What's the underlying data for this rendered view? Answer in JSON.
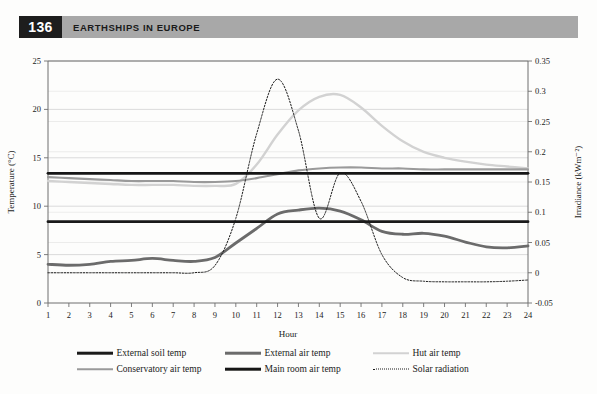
{
  "page": {
    "folio": "136",
    "running_title": "EARTHSHIPS IN EUROPE"
  },
  "colors": {
    "folio_box": "#1d1d1d",
    "running_bar": "#a8a8a8",
    "external_soil_temp": "#1a1a1a",
    "external_air_temp": "#6b6b6b",
    "hut_air_temp": "#d2d2d2",
    "conservatory_air_temp": "#9a9a9a",
    "main_room_air_temp": "#161616",
    "solar_radiation": "#1a1a1a",
    "grid": "#d7d7d7",
    "axis": "#6f6f6f"
  },
  "legend": {
    "items": [
      {
        "label": "External soil temp",
        "key": "external_soil_temp",
        "style": "solid",
        "weight": "thick",
        "color": "#1a1a1a"
      },
      {
        "label": "External air temp",
        "key": "external_air_temp",
        "style": "solid",
        "weight": "thick",
        "color": "#6b6b6b"
      },
      {
        "label": "Hut air temp",
        "key": "hut_air_temp",
        "style": "solid",
        "weight": "medium",
        "color": "#d2d2d2"
      },
      {
        "label": "Conservatory air temp",
        "key": "conservatory_air_temp",
        "style": "solid",
        "weight": "medium",
        "color": "#9a9a9a"
      },
      {
        "label": "Main room air temp",
        "key": "main_room_air_temp",
        "style": "solid",
        "weight": "thick",
        "color": "#161616"
      },
      {
        "label": "Solar radiation",
        "key": "solar_radiation",
        "style": "dotted",
        "weight": "thin",
        "color": "#1a1a1a"
      }
    ]
  },
  "chart_data": {
    "type": "line",
    "title": "",
    "xlabel": "Hour",
    "ylabel": "Temperature (°C)",
    "y2label": "Irradiance (kWm⁻²)",
    "xlim": [
      1,
      24
    ],
    "ylim": [
      0,
      25
    ],
    "y2lim": [
      -0.05,
      0.35
    ],
    "xticks": [
      1,
      2,
      3,
      4,
      5,
      6,
      7,
      8,
      9,
      10,
      11,
      12,
      13,
      14,
      15,
      16,
      17,
      18,
      19,
      20,
      21,
      22,
      23,
      24
    ],
    "yticks": [
      0,
      5,
      10,
      15,
      20,
      25
    ],
    "y2ticks": [
      -0.05,
      0,
      0.05,
      0.1,
      0.15,
      0.2,
      0.25,
      0.3,
      0.35
    ],
    "grid": true,
    "legend_position": "bottom",
    "x": [
      1,
      2,
      3,
      4,
      5,
      6,
      7,
      8,
      9,
      10,
      11,
      12,
      13,
      14,
      15,
      16,
      17,
      18,
      19,
      20,
      21,
      22,
      23,
      24
    ],
    "series": [
      {
        "name": "External soil temp",
        "axis": "left",
        "values": [
          8.4,
          8.4,
          8.4,
          8.4,
          8.4,
          8.4,
          8.4,
          8.4,
          8.4,
          8.4,
          8.4,
          8.4,
          8.4,
          8.4,
          8.4,
          8.4,
          8.4,
          8.4,
          8.4,
          8.4,
          8.4,
          8.4,
          8.4,
          8.4
        ]
      },
      {
        "name": "External air temp",
        "axis": "left",
        "values": [
          4.0,
          3.9,
          4.0,
          4.3,
          4.4,
          4.6,
          4.4,
          4.3,
          4.7,
          6.2,
          7.7,
          9.2,
          9.6,
          9.8,
          9.5,
          8.6,
          7.4,
          7.1,
          7.2,
          6.9,
          6.3,
          5.8,
          5.7,
          5.9
        ]
      },
      {
        "name": "Hut air temp",
        "axis": "left",
        "values": [
          12.6,
          12.5,
          12.4,
          12.3,
          12.2,
          12.2,
          12.2,
          12.1,
          12.1,
          12.3,
          14.3,
          17.4,
          19.9,
          21.3,
          21.5,
          20.2,
          18.3,
          16.7,
          15.6,
          15.0,
          14.6,
          14.3,
          14.1,
          13.9
        ]
      },
      {
        "name": "Conservatory air temp",
        "axis": "left",
        "values": [
          13.0,
          12.9,
          12.8,
          12.7,
          12.6,
          12.6,
          12.6,
          12.5,
          12.5,
          12.6,
          12.9,
          13.3,
          13.7,
          13.9,
          14.0,
          14.0,
          13.9,
          13.9,
          13.8,
          13.8,
          13.8,
          13.8,
          13.8,
          13.8
        ]
      },
      {
        "name": "Main room air temp",
        "axis": "left",
        "values": [
          13.4,
          13.4,
          13.4,
          13.4,
          13.4,
          13.4,
          13.4,
          13.4,
          13.4,
          13.4,
          13.4,
          13.4,
          13.4,
          13.4,
          13.4,
          13.4,
          13.4,
          13.4,
          13.4,
          13.4,
          13.4,
          13.4,
          13.4,
          13.4
        ]
      },
      {
        "name": "Solar radiation",
        "axis": "right",
        "values": [
          0.0,
          0.0,
          0.0,
          0.0,
          0.0,
          0.0,
          0.0,
          0.0,
          0.012,
          0.09,
          0.23,
          0.32,
          0.235,
          0.09,
          0.165,
          0.118,
          0.03,
          -0.008,
          -0.014,
          -0.015,
          -0.015,
          -0.015,
          -0.014,
          -0.012
        ]
      }
    ],
    "notes": {
      "solar_peak": {
        "hour": 12.0,
        "value": 0.32
      },
      "solar_dip": {
        "hour": 13.6,
        "value": 0.16
      },
      "solar_secondary_peak": {
        "hour": 14.3,
        "value": 0.175
      },
      "hut_peak": {
        "hour": 14.6,
        "value": 21.5
      }
    }
  }
}
